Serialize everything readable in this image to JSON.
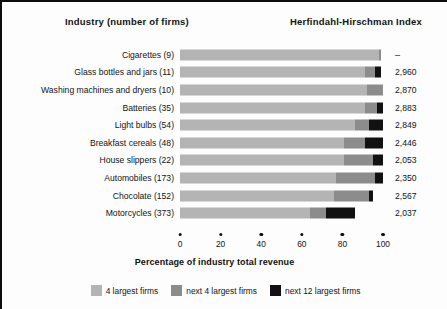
{
  "headers": {
    "industry": "Industry (number of firms)",
    "hhi": "Herfindahl-Hirschman Index"
  },
  "axis": {
    "title": "Percentage of industry total revenue",
    "ticks": [
      "0",
      "20",
      "40",
      "60",
      "80",
      "100"
    ]
  },
  "legend": [
    {
      "key": "s1",
      "label": "4 largest firms",
      "color": "#b4b4b4"
    },
    {
      "key": "s2",
      "label": "next 4 largest firms",
      "color": "#8c8c8c"
    },
    {
      "key": "s3",
      "label": "next 12 largest firms",
      "color": "#111111"
    }
  ],
  "chart_data": {
    "type": "bar",
    "title": "Percentage of industry total revenue",
    "xlabel": "Percentage of industry total revenue",
    "ylabel": "Industry (number of firms)",
    "xlim": [
      0,
      100
    ],
    "grid": false,
    "orientation": "horizontal",
    "stacked": true,
    "legend_position": "bottom",
    "categories": [
      "Cigarettes  (9)",
      "Glass bottles and jars  (11)",
      "Washing machines and dryers  (10)",
      "Batteries  (35)",
      "Light bulbs  (54)",
      "Breakfast cereals  (48)",
      "House slippers  (22)",
      "Automobiles  (173)",
      "Chocolate  (152)",
      "Motorcycles  (373)"
    ],
    "series": [
      {
        "name": "4 largest firms",
        "values": [
          98,
          91,
          92,
          91,
          86,
          81,
          81,
          77,
          76,
          64
        ]
      },
      {
        "name": "next 4 largest firms",
        "values": [
          1,
          5,
          8,
          6,
          7,
          10,
          14,
          19,
          17,
          8
        ]
      },
      {
        "name": "next 12 largest firms",
        "values": [
          0,
          3,
          0,
          3,
          7,
          9,
          5,
          4,
          2,
          14
        ]
      }
    ],
    "rows": [
      {
        "industry": "Cigarettes",
        "firms": "(9)",
        "label": "Cigarettes  (9)",
        "hhi": "–",
        "s1": 98,
        "s2": 1,
        "s3": 0
      },
      {
        "industry": "Glass bottles and jars",
        "firms": "(11)",
        "label": "Glass bottles and jars  (11)",
        "hhi": "2,960",
        "s1": 91,
        "s2": 5,
        "s3": 3
      },
      {
        "industry": "Washing machines and dryers",
        "firms": "(10)",
        "label": "Washing machines and dryers  (10)",
        "hhi": "2,870",
        "s1": 92,
        "s2": 8,
        "s3": 0
      },
      {
        "industry": "Batteries",
        "firms": "(35)",
        "label": "Batteries  (35)",
        "hhi": "2,883",
        "s1": 91,
        "s2": 6,
        "s3": 3
      },
      {
        "industry": "Light bulbs",
        "firms": "(54)",
        "label": "Light bulbs  (54)",
        "hhi": "2,849",
        "s1": 86,
        "s2": 7,
        "s3": 7
      },
      {
        "industry": "Breakfast cereals",
        "firms": "(48)",
        "label": "Breakfast cereals  (48)",
        "hhi": "2,446",
        "s1": 81,
        "s2": 10,
        "s3": 9
      },
      {
        "industry": "House slippers",
        "firms": "(22)",
        "label": "House slippers  (22)",
        "hhi": "2,053",
        "s1": 81,
        "s2": 14,
        "s3": 5
      },
      {
        "industry": "Automobiles",
        "firms": "(173)",
        "label": "Automobiles  (173)",
        "hhi": "2,350",
        "s1": 77,
        "s2": 19,
        "s3": 4
      },
      {
        "industry": "Chocolate",
        "firms": "(152)",
        "label": "Chocolate  (152)",
        "hhi": "2,567",
        "s1": 76,
        "s2": 17,
        "s3": 2
      },
      {
        "industry": "Motorcycles",
        "firms": "(373)",
        "label": "Motorcycles  (373)",
        "hhi": "2,037",
        "s1": 64,
        "s2": 8,
        "s3": 14
      }
    ]
  }
}
